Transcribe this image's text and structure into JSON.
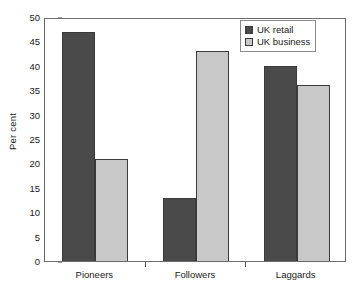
{
  "chart_data": {
    "type": "bar",
    "title": "",
    "subtitle": "",
    "xlabel": "",
    "ylabel": "Per cent",
    "categories": [
      "Pioneers",
      "Followers",
      "Laggards"
    ],
    "series": [
      {
        "name": "UK retail",
        "values": [
          47,
          13,
          40
        ],
        "color": "#4a4a4a"
      },
      {
        "name": "UK business",
        "values": [
          21,
          43,
          36
        ],
        "color": "#c8c8c8"
      }
    ],
    "ylim": [
      0,
      50
    ],
    "ytick_step": 5,
    "yticks": [
      "0",
      "5",
      "10",
      "15",
      "20",
      "25",
      "30",
      "35",
      "40",
      "45",
      "50"
    ],
    "grid": false,
    "legend_position": "top-right",
    "frame": true
  },
  "legend": {
    "items": [
      {
        "label": "UK retail",
        "swatch": "legend-swatch-dark"
      },
      {
        "label": "UK business",
        "swatch": "legend-swatch-light"
      }
    ]
  },
  "axes": {
    "y_title": "Per cent"
  }
}
